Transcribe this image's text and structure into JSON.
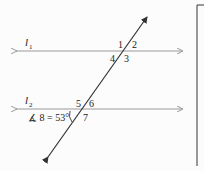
{
  "diagram": {
    "lines": [
      {
        "id": "l1",
        "label_main": "l",
        "label_sub": "1"
      },
      {
        "id": "l2",
        "label_main": "l",
        "label_sub": "2"
      }
    ],
    "angles_top": [
      "1",
      "2",
      "3",
      "4"
    ],
    "angles_bottom": [
      "5",
      "6",
      "7"
    ],
    "given": {
      "text": "∡ 8 = 53°"
    },
    "colors": {
      "parallel_lines": "#9a9a9a",
      "transversal": "#333333",
      "text": "#222222",
      "box_border": "#555555"
    }
  }
}
